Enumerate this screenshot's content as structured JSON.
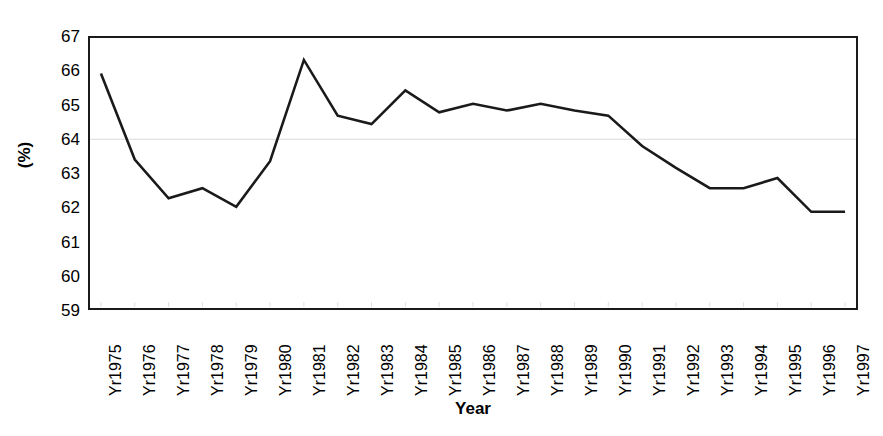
{
  "chart_data": {
    "type": "line",
    "title": "",
    "xlabel": "Year",
    "ylabel": "(%)",
    "categories": [
      "Yr1975",
      "Yr1976",
      "Yr1977",
      "Yr1978",
      "Yr1979",
      "Yr1980",
      "Yr1981",
      "Yr1982",
      "Yr1983",
      "Yr1984",
      "Yr1985",
      "Yr1986",
      "Yr1987",
      "Yr1988",
      "Yr1989",
      "Yr1990",
      "Yr1991",
      "Yr1992",
      "Yr1993",
      "Yr1994",
      "Yr1995",
      "Yr1996",
      "Yr1997"
    ],
    "values": [
      65.95,
      63.4,
      62.25,
      62.55,
      62.0,
      63.35,
      66.35,
      64.7,
      64.45,
      65.45,
      64.8,
      65.05,
      64.85,
      65.05,
      64.85,
      64.7,
      63.8,
      63.15,
      62.55,
      62.55,
      62.85,
      61.85,
      61.85
    ],
    "ylim": [
      59,
      67
    ],
    "ytick_labels": [
      "67",
      "66",
      "65",
      "64",
      "63",
      "62",
      "61",
      "60",
      "59"
    ],
    "ytick_values": [
      67,
      66,
      65,
      64,
      63,
      62,
      61,
      60,
      59
    ],
    "gridlines": [
      64
    ],
    "grid": "horizontal-single",
    "legend": "none",
    "line_color": "#1a1a1a",
    "line_width": 2.6,
    "markers": "none",
    "plot_border_color": "#1a1a1a",
    "gridline_color": "#d9d9d9",
    "background_color": "#ffffff"
  }
}
